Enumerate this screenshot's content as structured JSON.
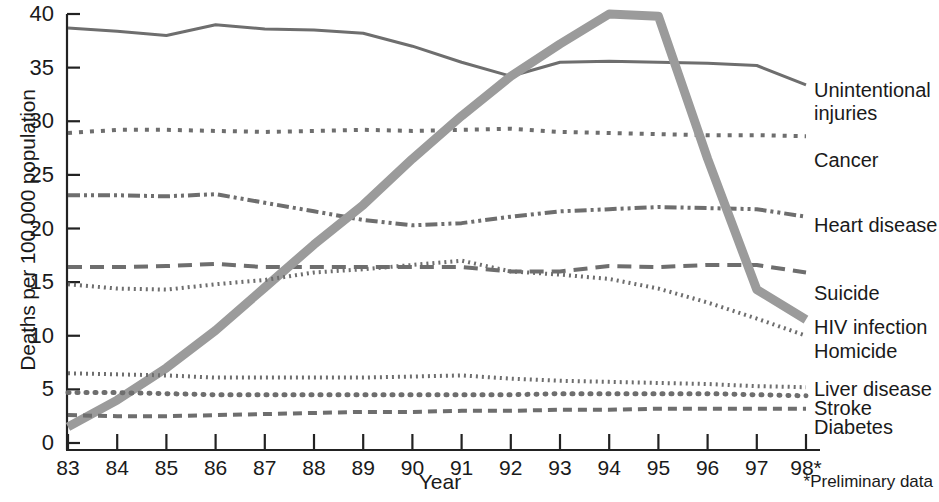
{
  "chart_data": {
    "type": "line",
    "title": "",
    "xlabel": "Year",
    "ylabel": "Deaths per 100,000 population",
    "footnote": "*Preliminary data",
    "grid": false,
    "legend_position": "right-inline",
    "xlim": [
      83,
      98
    ],
    "ylim": [
      0,
      40
    ],
    "yticks": [
      0,
      5,
      10,
      15,
      20,
      25,
      30,
      35,
      40
    ],
    "ytick_labels": [
      "0",
      "5",
      "10",
      "15",
      "20",
      "25",
      "30",
      "35",
      "40"
    ],
    "x": [
      83,
      84,
      85,
      86,
      87,
      88,
      89,
      90,
      91,
      92,
      93,
      94,
      95,
      96,
      97,
      98
    ],
    "xtick_labels": [
      "83",
      "84",
      "85",
      "86",
      "87",
      "88",
      "89",
      "90",
      "91",
      "92",
      "93",
      "94",
      "95",
      "96",
      "97",
      "98*"
    ],
    "series": [
      {
        "name": "Unintentional injuries",
        "label": "Unintentional",
        "label2": "injuries",
        "style": "solid",
        "color": "#6e6e6e",
        "width": 3,
        "dash": "",
        "values": [
          38.7,
          38.4,
          38.0,
          39.0,
          38.6,
          38.5,
          38.2,
          37.0,
          35.5,
          34.2,
          35.5,
          35.6,
          35.5,
          35.4,
          35.2,
          33.4
        ],
        "label_y": 80
      },
      {
        "name": "Cancer",
        "label": "Cancer",
        "style": "dotted-square",
        "color": "#6e6e6e",
        "width": 4,
        "dash": "4 7",
        "values": [
          28.9,
          29.2,
          29.2,
          29.1,
          29.0,
          29.1,
          29.2,
          29.1,
          29.2,
          29.3,
          29.0,
          28.9,
          28.8,
          28.7,
          28.7,
          28.6
        ],
        "label_y": 150
      },
      {
        "name": "Heart disease",
        "label": "Heart disease",
        "style": "dash-dot-dot",
        "color": "#6e6e6e",
        "width": 4,
        "dash": "12 4 3 4 3 4",
        "values": [
          23.1,
          23.1,
          23.0,
          23.2,
          22.4,
          21.6,
          20.8,
          20.3,
          20.5,
          21.1,
          21.6,
          21.8,
          22.0,
          21.9,
          21.8,
          21.1
        ],
        "label_y": 215
      },
      {
        "name": "Suicide",
        "label": "Suicide",
        "style": "long-dash",
        "color": "#6e6e6e",
        "width": 4,
        "dash": "14 8",
        "values": [
          16.4,
          16.4,
          16.5,
          16.7,
          16.4,
          16.4,
          16.4,
          16.4,
          16.4,
          16.0,
          16.0,
          16.5,
          16.4,
          16.6,
          16.6,
          15.9
        ],
        "label_y": 283
      },
      {
        "name": "HIV infection",
        "label": "HIV infection",
        "style": "thick-solid",
        "color": "#9b9b9b",
        "width": 9,
        "dash": "",
        "values": [
          1.5,
          4.0,
          7.0,
          10.5,
          14.5,
          18.5,
          22.2,
          26.5,
          30.5,
          34.2,
          37.2,
          40.0,
          39.8,
          26.5,
          14.3,
          11.5
        ],
        "label_y": 317
      },
      {
        "name": "Homicide",
        "label": "Homicide",
        "style": "fine-dotted",
        "color": "#6e6e6e",
        "width": 4,
        "dash": "2 4",
        "values": [
          14.8,
          14.4,
          14.3,
          14.8,
          15.2,
          15.9,
          16.2,
          16.6,
          17.0,
          16.0,
          15.7,
          15.3,
          14.4,
          13.1,
          11.6,
          10.0
        ],
        "label_y": 341
      },
      {
        "name": "Liver disease",
        "label": "Liver disease",
        "style": "fine-dotted",
        "color": "#6e6e6e",
        "width": 4,
        "dash": "2 4",
        "values": [
          6.5,
          6.4,
          6.3,
          6.1,
          6.1,
          6.1,
          6.1,
          6.2,
          6.3,
          6.0,
          5.8,
          5.7,
          5.6,
          5.5,
          5.3,
          5.2
        ],
        "label_y": 379
      },
      {
        "name": "Stroke",
        "label": "Stroke",
        "style": "round-dot",
        "color": "#6e6e6e",
        "width": 5,
        "dash": "1 8",
        "values": [
          4.7,
          4.7,
          4.6,
          4.5,
          4.5,
          4.5,
          4.5,
          4.5,
          4.5,
          4.5,
          4.6,
          4.6,
          4.6,
          4.6,
          4.5,
          4.4
        ],
        "label_y": 398
      },
      {
        "name": "Diabetes",
        "label": "Diabetes",
        "style": "medium-dash",
        "color": "#6e6e6e",
        "width": 4,
        "dash": "9 6",
        "values": [
          2.6,
          2.5,
          2.5,
          2.6,
          2.7,
          2.8,
          2.9,
          2.9,
          3.0,
          3.0,
          3.1,
          3.1,
          3.2,
          3.2,
          3.2,
          3.2
        ],
        "label_y": 417
      }
    ]
  }
}
